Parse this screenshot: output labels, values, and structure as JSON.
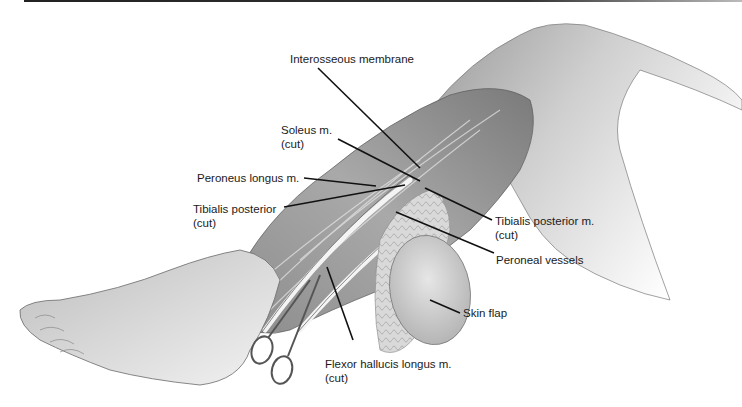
{
  "figure": {
    "type": "anatomical illustration",
    "labels": [
      {
        "id": "interosseous",
        "line1": "Interosseous membrane",
        "line2": ""
      },
      {
        "id": "soleus",
        "line1": "Soleus m.",
        "line2": "(cut)"
      },
      {
        "id": "peroneus-longus",
        "line1": "Peroneus longus m.",
        "line2": ""
      },
      {
        "id": "tibialis-posterior-left",
        "line1": "Tibialis posterior",
        "line2": "(cut)"
      },
      {
        "id": "tibialis-posterior-right",
        "line1": "Tibialis posterior m.",
        "line2": "(cut)"
      },
      {
        "id": "peroneal-vessels",
        "line1": "Peroneal vessels",
        "line2": ""
      },
      {
        "id": "skin-flap",
        "line1": "Skin flap",
        "line2": ""
      },
      {
        "id": "flexor-hallucis",
        "line1": "Flexor hallucis longus m.",
        "line2": "(cut)"
      }
    ]
  }
}
